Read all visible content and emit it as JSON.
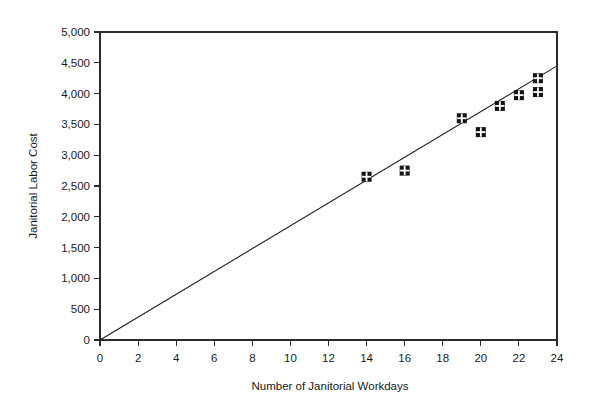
{
  "chart_data": {
    "type": "scatter",
    "title": "",
    "xlabel": "Number of Janitorial Workdays",
    "ylabel": "Janitorial Labor Cost",
    "xlim": [
      0,
      24
    ],
    "ylim": [
      0,
      5000
    ],
    "xticks": [
      0,
      2,
      4,
      6,
      8,
      10,
      12,
      14,
      16,
      18,
      20,
      22,
      24
    ],
    "xtick_labels": [
      "0",
      "2",
      "4",
      "6",
      "8",
      "10",
      "12",
      "14",
      "16",
      "18",
      "20",
      "22",
      "24"
    ],
    "yticks": [
      0,
      500,
      1000,
      1500,
      2000,
      2500,
      3000,
      3500,
      4000,
      4500,
      5000
    ],
    "ytick_labels": [
      "0",
      "500",
      "1,000",
      "1,500",
      "2,000",
      "2,500",
      "3,000",
      "3,500",
      "4,000",
      "4,500",
      "5,000"
    ],
    "grid": false,
    "legend": false,
    "legend_position": "none",
    "series": [
      {
        "name": "Janitorial Labor Cost",
        "marker": "windowpane-square",
        "color": "#141414",
        "points": [
          {
            "x": 14,
            "y": 2650
          },
          {
            "x": 16,
            "y": 2750
          },
          {
            "x": 19,
            "y": 3600
          },
          {
            "x": 20,
            "y": 3375
          },
          {
            "x": 21,
            "y": 3800
          },
          {
            "x": 22,
            "y": 3975
          },
          {
            "x": 23,
            "y": 4250
          },
          {
            "x": 23,
            "y": 4025
          }
        ]
      }
    ],
    "fit_line": {
      "name": "least-squares regression line",
      "color": "#1a1a1a",
      "x_start": 0,
      "y_start": 0,
      "x_end": 24,
      "y_end": 4450
    }
  }
}
